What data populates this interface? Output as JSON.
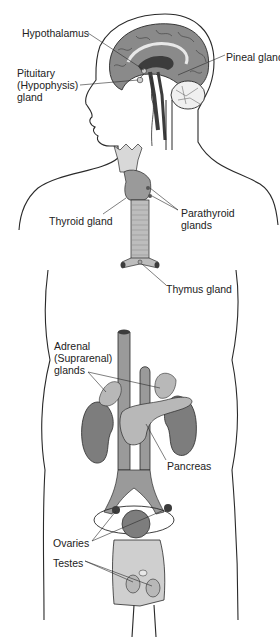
{
  "diagram": {
    "type": "anatomical-illustration",
    "labels": [
      {
        "id": "hypothalamus",
        "text": "Hypothalamus",
        "x": 22,
        "y": 27
      },
      {
        "id": "pineal",
        "text": "Pineal gland",
        "x": 226,
        "y": 51
      },
      {
        "id": "pituitary",
        "text": "Pituitary\n(Hypophysis)\ngland",
        "x": 17,
        "y": 67
      },
      {
        "id": "thyroid",
        "text": "Thyroid gland",
        "x": 49,
        "y": 215
      },
      {
        "id": "parathyroid",
        "text": "Parathyroid\nglands",
        "x": 181,
        "y": 207
      },
      {
        "id": "thymus",
        "text": "Thymus gland",
        "x": 166,
        "y": 283
      },
      {
        "id": "adrenal",
        "text": "Adrenal\n(Suprarenal)\nglands",
        "x": 54,
        "y": 340
      },
      {
        "id": "pancreas",
        "text": "Pancreas",
        "x": 167,
        "y": 460
      },
      {
        "id": "ovaries",
        "text": "Ovaries",
        "x": 53,
        "y": 537
      },
      {
        "id": "testes",
        "text": "Testes",
        "x": 53,
        "y": 557
      }
    ],
    "colors": {
      "outline": "#2a2a2a",
      "brain_gray": "#8a8a8a",
      "dark_gray": "#3c3c3c",
      "organ_mid": "#7d7d7d",
      "organ_light": "#b8b8b8",
      "tissue_light": "#cfcfcf",
      "background": "#ffffff",
      "text": "#222222"
    }
  }
}
